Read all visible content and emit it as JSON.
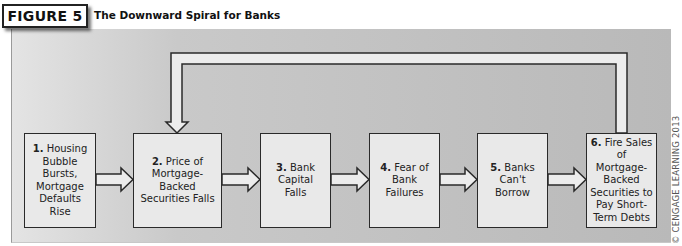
{
  "figure": {
    "label": "FIGURE 5",
    "title": "The Downward Spiral for Banks"
  },
  "steps": [
    {
      "number": "1.",
      "text": "Housing Bubble Bursts, Mortgage Defaults Rise"
    },
    {
      "number": "2.",
      "text": "Price of Mortgage-Backed Securities Falls"
    },
    {
      "number": "3.",
      "text": "Bank Capital Falls"
    },
    {
      "number": "4.",
      "text": "Fear of Bank Failures"
    },
    {
      "number": "5.",
      "text": "Banks Can't Borrow"
    },
    {
      "number": "6.",
      "text": "Fire Sales of Mortgage-Backed Securities to Pay Short-Term Debts"
    }
  ],
  "flow": {
    "arrows": [
      {
        "from": 1,
        "to": 2
      },
      {
        "from": 2,
        "to": 3
      },
      {
        "from": 3,
        "to": 4
      },
      {
        "from": 4,
        "to": 5
      },
      {
        "from": 5,
        "to": 6
      },
      {
        "from": 6,
        "to": 2,
        "type": "feedback-loop"
      }
    ]
  },
  "copyright": "© CENGAGE LEARNING 2013",
  "colors": {
    "panel_light": "#e4e4e4",
    "panel_dark": "#b9b9b9",
    "box_fill": "#e9e9e9",
    "stroke": "#2a2a2a"
  }
}
